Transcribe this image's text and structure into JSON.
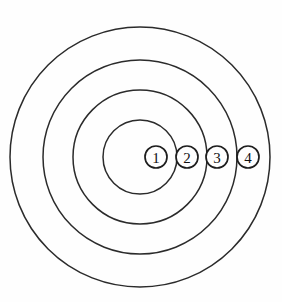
{
  "figure": {
    "type": "concentric-rings-diagram",
    "background_color": "#fefefe",
    "stroke_color": "#2b2b2b",
    "label_color": "#111111",
    "center": {
      "x": 140,
      "y": 157
    },
    "rings": [
      {
        "index": 1,
        "name": "innermost-ring",
        "radius": 37
      },
      {
        "index": 2,
        "name": "second-ring",
        "radius": 67
      },
      {
        "index": 3,
        "name": "third-ring",
        "radius": 97
      },
      {
        "index": 4,
        "name": "outermost-ring",
        "radius": 130
      }
    ],
    "markers": [
      {
        "id": "marker-1",
        "label": "1",
        "x": 156,
        "y": 157,
        "radius": 11
      },
      {
        "id": "marker-2",
        "label": "2",
        "x": 187,
        "y": 157,
        "radius": 11
      },
      {
        "id": "marker-3",
        "label": "3",
        "x": 217,
        "y": 157,
        "radius": 11
      },
      {
        "id": "marker-4",
        "label": "4",
        "x": 248,
        "y": 157,
        "radius": 11
      }
    ]
  }
}
